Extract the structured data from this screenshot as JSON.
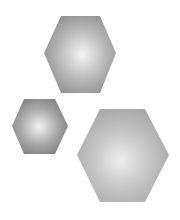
{
  "canvas": {
    "width": 180,
    "height": 220,
    "background": "#ffffff"
  },
  "shapes": [
    {
      "name": "hexagon-top",
      "points": "61,16 100,16 116,53 100,93 61,93 44,53",
      "highlight_cx": "53%",
      "highlight_cy": "50%",
      "center_color": "#f4f4f4",
      "mid_color": "#b8b8b8",
      "edge_color": "#8c8c8c"
    },
    {
      "name": "hexagon-small",
      "points": "24,99 55,99 68,126 55,154 24,154 12,126",
      "highlight_cx": "48%",
      "highlight_cy": "50%",
      "center_color": "#f2f2f2",
      "mid_color": "#a9a9a9",
      "edge_color": "#7a7a7a"
    },
    {
      "name": "hexagon-large",
      "points": "100,109 145,109 169,155 145,202 100,202 77,155",
      "highlight_cx": "48%",
      "highlight_cy": "55%",
      "center_color": "#eeeeee",
      "mid_color": "#c2c2c2",
      "edge_color": "#a6a6a6"
    }
  ]
}
